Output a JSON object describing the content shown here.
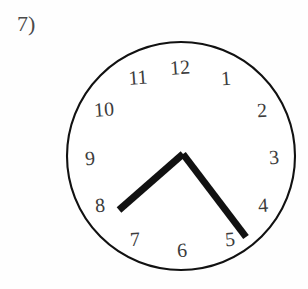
{
  "worksheet": {
    "problem_label": "7)",
    "background_color": "#fefefe"
  },
  "clock": {
    "title": "analog-clock-face",
    "dial": {
      "center": {
        "x": 181,
        "y": 156
      },
      "radius": 114,
      "outline_color": "#111111",
      "outline_width": 2.1,
      "fill_color": "#ffffff"
    },
    "numerals": [
      {
        "label": "12",
        "x": 180,
        "y": 67
      },
      {
        "label": "1",
        "x": 226,
        "y": 78
      },
      {
        "label": "2",
        "x": 262,
        "y": 110
      },
      {
        "label": "3",
        "x": 274,
        "y": 157
      },
      {
        "label": "4",
        "x": 263,
        "y": 205
      },
      {
        "label": "5",
        "x": 230,
        "y": 239
      },
      {
        "label": "6",
        "x": 182,
        "y": 250
      },
      {
        "label": "7",
        "x": 135,
        "y": 239
      },
      {
        "label": "8",
        "x": 100,
        "y": 205
      },
      {
        "label": "9",
        "x": 90,
        "y": 158
      },
      {
        "label": "10",
        "x": 104,
        "y": 109
      },
      {
        "label": "11",
        "x": 138,
        "y": 77
      }
    ],
    "hands": [
      {
        "name": "hour-hand",
        "points_to": "8",
        "color": "#111111",
        "width": 7,
        "from": {
          "x": 183,
          "y": 154
        },
        "to": {
          "x": 119,
          "y": 210
        }
      },
      {
        "name": "minute-hand",
        "points_to": "between 4 and 5",
        "color": "#111111",
        "width": 7,
        "from": {
          "x": 183,
          "y": 154
        },
        "to": {
          "x": 246,
          "y": 237
        }
      }
    ]
  }
}
